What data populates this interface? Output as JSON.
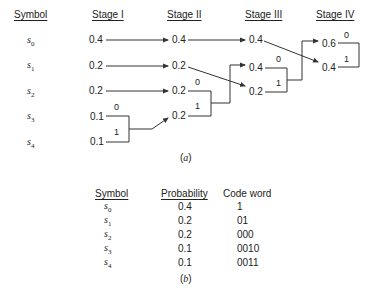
{
  "diagram_a": {
    "headers": [
      "Symbol",
      "Stage I",
      "Stage II",
      "Stage III",
      "Stage IV"
    ],
    "symbols": [
      "s",
      "s",
      "s",
      "s",
      "s"
    ],
    "symbol_subs": [
      "0",
      "1",
      "2",
      "3",
      "4"
    ],
    "stage1": [
      "0.4",
      "0.2",
      "0.2",
      "0.1",
      "0.1"
    ],
    "stage2": [
      "0.4",
      "0.2",
      "0.2",
      "0.2"
    ],
    "stage3": [
      "0.4",
      "0.4",
      "0.2"
    ],
    "stage4": [
      "0.6",
      "0.4"
    ],
    "bits": {
      "zero": "0",
      "one": "1"
    },
    "caption": "a"
  },
  "table_b": {
    "headers": {
      "symbol": "Symbol",
      "probability": "Probability",
      "codeword": "Code word"
    },
    "rows": [
      {
        "sym": "s",
        "sub": "0",
        "prob": "0.4",
        "code": "1"
      },
      {
        "sym": "s",
        "sub": "1",
        "prob": "0.2",
        "code": "01"
      },
      {
        "sym": "s",
        "sub": "2",
        "prob": "0.2",
        "code": "000"
      },
      {
        "sym": "s",
        "sub": "3",
        "prob": "0.1",
        "code": "0010"
      },
      {
        "sym": "s",
        "sub": "4",
        "prob": "0.1",
        "code": "0011"
      }
    ],
    "caption": "b"
  }
}
